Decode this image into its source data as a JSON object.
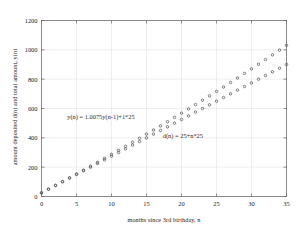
{
  "chart_data": {
    "type": "scatter",
    "title": "",
    "xlabel": "months since 3rd birthday, n",
    "ylabel": "amount deposited d(n) and total amount, y(n)",
    "xlim": [
      0,
      35
    ],
    "ylim": [
      0,
      1200
    ],
    "xticks": [
      0,
      5,
      10,
      15,
      20,
      25,
      30,
      35
    ],
    "yticks": [
      0,
      200,
      400,
      600,
      800,
      1000,
      1200
    ],
    "grid": true,
    "legend": "none",
    "marker": "open-circle",
    "marker_color": "#555555",
    "x": [
      0,
      1,
      2,
      3,
      4,
      5,
      6,
      7,
      8,
      9,
      10,
      11,
      12,
      13,
      14,
      15,
      16,
      17,
      18,
      19,
      20,
      21,
      22,
      23,
      24,
      25,
      26,
      27,
      28,
      29,
      30,
      31,
      32,
      33,
      34,
      35
    ],
    "series": [
      {
        "name": "y(n)",
        "equation": "y(n) = 1.0075y(n-1)+1*25",
        "values": [
          25,
          50.4,
          76,
          101.8,
          127.7,
          153.9,
          180.2,
          206.8,
          233.4,
          260.3,
          287.3,
          314.5,
          341.9,
          369.5,
          397.3,
          425.3,
          453.4,
          481.8,
          510.4,
          539.2,
          568.2,
          597.4,
          626.8,
          656.5,
          686.4,
          716.5,
          746.8,
          777.4,
          808.2,
          839.2,
          870.5,
          902.1,
          933.8,
          965.9,
          998.1,
          1030.6
        ]
      },
      {
        "name": "d(n)",
        "equation": "d(n) = 25+n*25",
        "values": [
          25,
          50,
          75,
          100,
          125,
          150,
          175,
          200,
          225,
          250,
          275,
          300,
          325,
          350,
          375,
          400,
          425,
          450,
          475,
          500,
          525,
          550,
          575,
          600,
          625,
          650,
          675,
          700,
          725,
          750,
          775,
          800,
          825,
          850,
          875,
          900
        ]
      }
    ],
    "annotations": [
      {
        "text": "y(n) = 1.0075y(n-1)+1*25",
        "x": 8.5,
        "y": 530
      },
      {
        "text": "d(n) = 25+n*25",
        "x": 20.2,
        "y": 400
      }
    ]
  }
}
